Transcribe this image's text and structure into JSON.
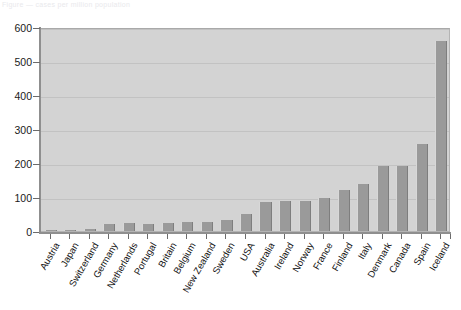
{
  "header": {
    "clipped_text": "Figure  —  cases per million population"
  },
  "colors": {
    "bar": "#9a9a9a",
    "plot_background": "#d3d3d3",
    "gridline": "#c2c2c2",
    "axis": "#8f8f8f",
    "text": "#111111"
  },
  "chart_data": {
    "type": "bar",
    "title": "",
    "xlabel": "",
    "ylabel": "",
    "ylim": [
      0,
      600
    ],
    "ytick_step": 100,
    "yticks": [
      0,
      100,
      200,
      300,
      400,
      500,
      600
    ],
    "ytick_labels": [
      "0",
      "100",
      "200",
      "300",
      "400",
      "500",
      "600"
    ],
    "grid": true,
    "legend": "none",
    "categories": [
      "Austria",
      "Japan",
      "Switzerland",
      "Germany",
      "Netherlands",
      "Portugal",
      "Britain",
      "Belgium",
      "New Zealand",
      "Sweden",
      "USA",
      "Australia",
      "Ireland",
      "Norway",
      "France",
      "Finland",
      "Italy",
      "Denmark",
      "Canada",
      "Spain",
      "Iceland"
    ],
    "values": [
      3,
      4,
      6,
      22,
      24,
      22,
      23,
      26,
      26,
      33,
      50,
      84,
      88,
      88,
      97,
      122,
      139,
      190,
      190,
      255,
      560
    ]
  }
}
